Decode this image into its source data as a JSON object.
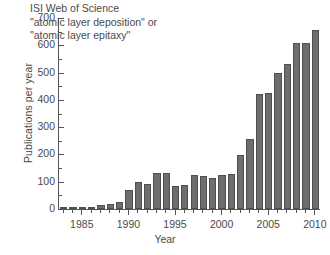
{
  "chart_data": {
    "type": "bar",
    "title": "",
    "xlabel": "Year",
    "ylabel": "Publications per year",
    "xlim": [
      1982.4,
      1982.4
    ],
    "ylim": [
      0,
      700
    ],
    "ytick_step": 100,
    "yminor_step": 50,
    "xtick_step": 5,
    "xminor_step": 1,
    "grid": false,
    "legend": null,
    "bar_color": "#6e6e6e",
    "bar_edge_color": "#4f4f4f",
    "axis_color": "#555555",
    "text_color": "#4a4a4a",
    "annotation_lines": [
      "ISI Web of Science",
      "\"atomic layer deposition\" or",
      "\"atomic layer epitaxy\""
    ],
    "ytick_labels": [
      "0",
      "100",
      "200",
      "300",
      "400",
      "500",
      "600",
      "700"
    ],
    "ytick_values": [
      0,
      100,
      200,
      300,
      400,
      500,
      600,
      700
    ],
    "xtick_labels": [
      "1985",
      "1990",
      "1995",
      "2000",
      "2005",
      "2010"
    ],
    "xtick_values": [
      1985,
      1990,
      1995,
      2000,
      2005,
      2010
    ],
    "categories": [
      1983,
      1984,
      1985,
      1986,
      1987,
      1988,
      1989,
      1990,
      1991,
      1992,
      1993,
      1994,
      1995,
      1996,
      1997,
      1998,
      1999,
      2000,
      2001,
      2002,
      2003,
      2004,
      2005,
      2006,
      2007,
      2008,
      2009,
      2010
    ],
    "values": [
      5,
      3,
      4,
      8,
      13,
      20,
      27,
      71,
      99,
      93,
      131,
      131,
      84,
      89,
      124,
      121,
      114,
      124,
      128,
      198,
      255,
      421,
      427,
      500,
      533,
      607,
      607,
      656
    ]
  }
}
